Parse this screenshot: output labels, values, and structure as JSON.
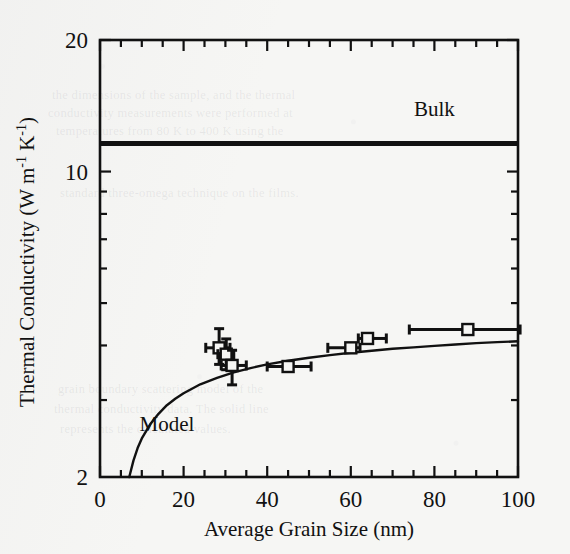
{
  "figure": {
    "background_color": "#f6f6f4",
    "ink_color": "#111111"
  },
  "ghost_lines": [
    "the dimensions of the sample, and the thermal",
    "conductivity measurements were performed at",
    "temperatures from 80 K to 400 K using the",
    "standard three-omega technique on the films.",
    "grain boundary scattering model of the",
    "thermal conductivity data. The solid line",
    "represents the calculated values."
  ],
  "chart_data": {
    "type": "scatter",
    "title": "",
    "xlabel": "Average Grain Size (nm)",
    "ylabel": "Thermal Conductivity (W m⁻¹ K⁻¹)",
    "ylabel_parts": {
      "lead": "Thermal Conductivity (W m",
      "sup1": "-1",
      "mid": " K",
      "sup2": "-1",
      "tail": ")"
    },
    "xscale": "linear",
    "yscale": "log",
    "xlim": [
      0,
      100
    ],
    "ylim": [
      2,
      20
    ],
    "xticks": [
      0,
      20,
      40,
      60,
      80,
      100
    ],
    "xticklabels": [
      "0",
      "20",
      "40",
      "60",
      "80",
      "100"
    ],
    "yticks": [
      10,
      20
    ],
    "yticklabels": [
      "10",
      "20"
    ],
    "ybottom_label": "2",
    "yminor_ticks": [
      3,
      4,
      5,
      6,
      7,
      8,
      9,
      10,
      20
    ],
    "xminor_ticks": [
      5,
      10,
      15,
      25,
      30,
      35,
      45,
      50,
      55,
      65,
      70,
      75,
      85,
      90,
      95
    ],
    "grid": false,
    "legend": "none",
    "series": [
      {
        "name": "Measured thin films",
        "marker": "open-square",
        "marker_size": 11,
        "points": [
          {
            "x": 28.5,
            "y": 3.95,
            "xerr_low": 3.2,
            "xerr_high": 2.6,
            "yerr_low": 0.33,
            "yerr_high": 0.42
          },
          {
            "x": 30.2,
            "y": 3.82,
            "xerr_low": 2.0,
            "xerr_high": 1.8,
            "yerr_low": 0.3,
            "yerr_high": 0.32
          },
          {
            "x": 31.6,
            "y": 3.6,
            "xerr_low": 2.6,
            "xerr_high": 3.4,
            "yerr_low": 0.35,
            "yerr_high": 0.3
          },
          {
            "x": 45.0,
            "y": 3.58,
            "xerr_low": 5.0,
            "xerr_high": 5.5,
            "yerr_low": 0.0,
            "yerr_high": 0.0
          },
          {
            "x": 60.0,
            "y": 3.95,
            "xerr_low": 5.5,
            "xerr_high": 2.2,
            "yerr_low": 0.0,
            "yerr_high": 0.0
          },
          {
            "x": 64.0,
            "y": 4.15,
            "xerr_low": 2.2,
            "xerr_high": 4.5,
            "yerr_low": 0.0,
            "yerr_high": 0.0
          },
          {
            "x": 88.0,
            "y": 4.35,
            "xerr_low": 14.0,
            "xerr_high": 12.5,
            "yerr_low": 0.0,
            "yerr_high": 0.0
          }
        ]
      }
    ],
    "lines": [
      {
        "name": "Bulk",
        "label": "Bulk",
        "style": "solid-thick",
        "type": "horizontal",
        "y_value": 11.6,
        "label_x": 80,
        "label_y": 13.4
      },
      {
        "name": "Model",
        "label": "Model",
        "style": "solid",
        "type": "curve",
        "label_x": 16,
        "label_y": 2.55,
        "points": [
          {
            "x": 7.0,
            "y": 2.0
          },
          {
            "x": 8.0,
            "y": 2.18
          },
          {
            "x": 9.0,
            "y": 2.33
          },
          {
            "x": 10.0,
            "y": 2.45
          },
          {
            "x": 12.0,
            "y": 2.64
          },
          {
            "x": 14.0,
            "y": 2.79
          },
          {
            "x": 16.0,
            "y": 2.92
          },
          {
            "x": 18.0,
            "y": 3.02
          },
          {
            "x": 20.0,
            "y": 3.11
          },
          {
            "x": 24.0,
            "y": 3.26
          },
          {
            "x": 28.0,
            "y": 3.37
          },
          {
            "x": 32.0,
            "y": 3.47
          },
          {
            "x": 36.0,
            "y": 3.55
          },
          {
            "x": 40.0,
            "y": 3.62
          },
          {
            "x": 45.0,
            "y": 3.69
          },
          {
            "x": 50.0,
            "y": 3.75
          },
          {
            "x": 55.0,
            "y": 3.8
          },
          {
            "x": 60.0,
            "y": 3.85
          },
          {
            "x": 65.0,
            "y": 3.89
          },
          {
            "x": 70.0,
            "y": 3.93
          },
          {
            "x": 75.0,
            "y": 3.96
          },
          {
            "x": 80.0,
            "y": 3.99
          },
          {
            "x": 85.0,
            "y": 4.02
          },
          {
            "x": 90.0,
            "y": 4.05
          },
          {
            "x": 95.0,
            "y": 4.07
          },
          {
            "x": 100.0,
            "y": 4.09
          }
        ]
      }
    ]
  }
}
